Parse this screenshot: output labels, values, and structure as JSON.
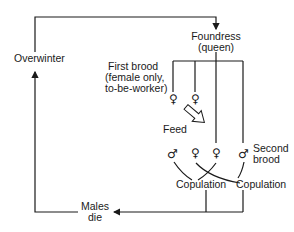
{
  "diagram": {
    "nodes": {
      "overwinter": "Overwinter",
      "foundress_line1": "Foundress",
      "foundress_line2": "(queen)",
      "first_brood_line1": "First brood",
      "first_brood_line2": "(female only,",
      "first_brood_line3": "to-be-worker)",
      "feed": "Feed",
      "second_brood_line1": "Second",
      "second_brood_line2": "brood",
      "copulation_1": "Copulation",
      "copulation_2": "Copulation",
      "males_die_line1": "Males",
      "males_die_line2": "die"
    },
    "symbols": {
      "female": "♀",
      "male": "♂"
    },
    "colors": {
      "line": "#1a1a1a",
      "background": "#ffffff"
    }
  }
}
